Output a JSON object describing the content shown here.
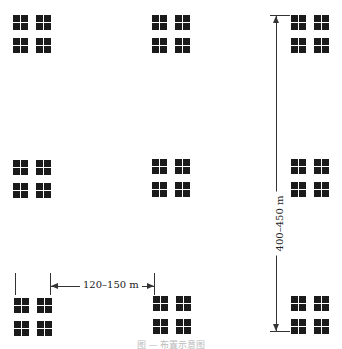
{
  "diagram": {
    "type": "grid-layout-of-building-clusters",
    "rows": 3,
    "columns": 3,
    "cluster_symbol": "2x2 group of four-pane window squares",
    "dimensions": {
      "horizontal_spacing": "120–150 m",
      "vertical_spacing": "400–450 m"
    },
    "caption": "图 — 布置示意图"
  }
}
